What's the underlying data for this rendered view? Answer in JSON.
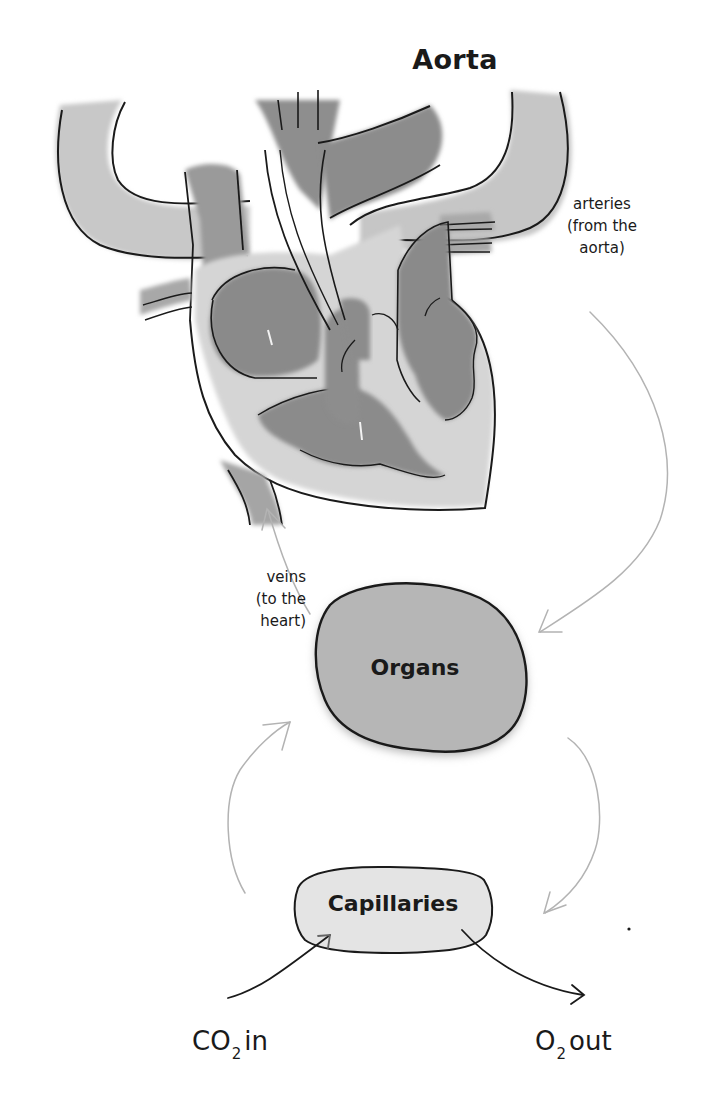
{
  "diagram": {
    "title": "Aorta",
    "labels": {
      "arteries": [
        "arteries",
        "(from the",
        "aorta)"
      ],
      "veins": [
        "veins",
        "(to the",
        "heart)"
      ],
      "organs": "Organs",
      "capillaries": "Capillaries",
      "co2_in": {
        "prefix": "CO",
        "subscript": "2",
        "suffix": "in"
      },
      "o2_out": {
        "prefix": "O",
        "subscript": "2",
        "suffix": "out"
      }
    },
    "nodes": [
      {
        "id": "heart",
        "label": "Heart (illustration)"
      },
      {
        "id": "organs",
        "label": "Organs"
      },
      {
        "id": "capillaries",
        "label": "Capillaries"
      }
    ],
    "edges": [
      {
        "from": "heart",
        "to": "organs",
        "label": "arteries (from the aorta)"
      },
      {
        "from": "organs",
        "to": "heart",
        "label": "veins (to the heart)"
      },
      {
        "from": "organs",
        "to": "capillaries",
        "label": ""
      },
      {
        "from": "capillaries",
        "to": "organs",
        "label": ""
      },
      {
        "from": "CO2",
        "to": "capillaries",
        "label": "CO2 in"
      },
      {
        "from": "capillaries",
        "to": "O2",
        "label": "O2 out"
      }
    ],
    "colors": {
      "background": "#ffffff",
      "ink": "#1a1a1a",
      "vessel_light": "#c9c9c9",
      "chamber_dark": "#8a8a8a",
      "heart_wall": "#d6d6d6",
      "arrow_gray": "#b5b5b5",
      "organs_fill": "#b3b3b3",
      "capillaries_fill": "#e6e6e6"
    }
  }
}
